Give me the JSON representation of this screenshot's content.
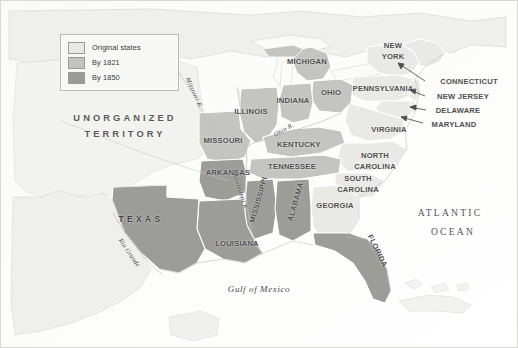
{
  "figure": {
    "name": "united-states-expansion-map",
    "background_color": "#fbfbfa",
    "border_color": "#d8d8d5"
  },
  "legend": {
    "name": "map-legend",
    "items": [
      {
        "label": "Original states",
        "color": "#e8e8e4",
        "key": "original"
      },
      {
        "label": "By 1821",
        "color": "#c3c3bf",
        "key": "by1821"
      },
      {
        "label": "By 1850",
        "color": "#9b9b97",
        "key": "by1850"
      }
    ]
  },
  "territories": [
    {
      "label": "UNORGANIZED\nTERRITORY",
      "line1": "UNORGANIZED",
      "line2": "TERRITORY",
      "x": 124,
      "y": 124,
      "fill": "none"
    }
  ],
  "states": [
    {
      "label": "MICHIGAN",
      "x": 306,
      "y": 61,
      "fill": "by1821"
    },
    {
      "label": "NEW\nYORK",
      "line1": "NEW",
      "line2": "YORK",
      "x": 392,
      "y": 51,
      "fill": "original"
    },
    {
      "label": "PENNSYLVANIA",
      "x": 382,
      "y": 88,
      "fill": "original"
    },
    {
      "label": "OHIO",
      "x": 330,
      "y": 92,
      "fill": "by1821"
    },
    {
      "label": "INDIANA",
      "x": 292,
      "y": 100,
      "fill": "by1821"
    },
    {
      "label": "ILLINOIS",
      "x": 250,
      "y": 111,
      "fill": "by1821"
    },
    {
      "label": "MISSOURI",
      "x": 222,
      "y": 140,
      "fill": "by1821"
    },
    {
      "label": "KENTUCKY",
      "x": 298,
      "y": 144,
      "fill": "by1821"
    },
    {
      "label": "VIRGINIA",
      "x": 388,
      "y": 129,
      "fill": "original"
    },
    {
      "label": "ARKANSAS",
      "x": 227,
      "y": 172,
      "fill": "by1850"
    },
    {
      "label": "TENNESSEE",
      "x": 291,
      "y": 166,
      "fill": "by1821"
    },
    {
      "label": "NORTH\nCAROLINA",
      "line1": "NORTH",
      "line2": "CAROLINA",
      "x": 374,
      "y": 161,
      "fill": "original"
    },
    {
      "label": "SOUTH\nCAROLINA",
      "line1": "SOUTH",
      "line2": "CAROLINA",
      "x": 357,
      "y": 184,
      "fill": "original"
    },
    {
      "label": "GEORGIA",
      "x": 334,
      "y": 205,
      "fill": "original"
    },
    {
      "label": "MISSISSIPPI",
      "x": 258,
      "y": 199,
      "fill": "by1850",
      "rotate": -74
    },
    {
      "label": "ALABAMA",
      "x": 295,
      "y": 201,
      "fill": "by1850",
      "rotate": -74
    },
    {
      "label": "LOUISIANA",
      "x": 236,
      "y": 243,
      "fill": "by1850"
    },
    {
      "label": "FLORIDA",
      "x": 376,
      "y": 250,
      "fill": "by1850",
      "rotate": 64
    },
    {
      "label": "TEXAS",
      "x": 140,
      "y": 219,
      "fill": "by1850",
      "style": "texas"
    }
  ],
  "callout_states": [
    {
      "label": "CONNECTICUT",
      "x": 468,
      "y": 81,
      "fill": "original"
    },
    {
      "label": "NEW JERSEY",
      "x": 462,
      "y": 96,
      "fill": "original"
    },
    {
      "label": "DELAWARE",
      "x": 457,
      "y": 110,
      "fill": "original"
    },
    {
      "label": "MARYLAND",
      "x": 453,
      "y": 124,
      "fill": "original"
    }
  ],
  "water_labels": [
    {
      "label": "ATLANTIC",
      "x": 449,
      "y": 212,
      "style": "ocean"
    },
    {
      "label": "OCEAN",
      "x": 452,
      "y": 231,
      "style": "ocean"
    },
    {
      "label": "Gulf of Mexico",
      "x": 258,
      "y": 289,
      "style": "water"
    }
  ],
  "river_labels": [
    {
      "label": "Missouri R.",
      "x": 193,
      "y": 92,
      "rotate": 66
    },
    {
      "label": "Mississippi R.",
      "x": 239,
      "y": 190,
      "rotate": 72
    },
    {
      "label": "Ohio R.",
      "x": 283,
      "y": 129,
      "rotate": -30
    },
    {
      "label": "Rio Grande",
      "x": 128,
      "y": 252,
      "rotate": 56
    }
  ],
  "colors": {
    "original": "#e9e9e5",
    "by1821": "#c4c4c0",
    "by1850": "#9c9c98",
    "unorganized": "#f2f2ef",
    "land_other": "#efefec",
    "water": "#fdfdfc",
    "outline": "#ffffff",
    "coast": "#b5b5b0",
    "river": "#c7c7c2",
    "text": "#4f4f4f"
  }
}
